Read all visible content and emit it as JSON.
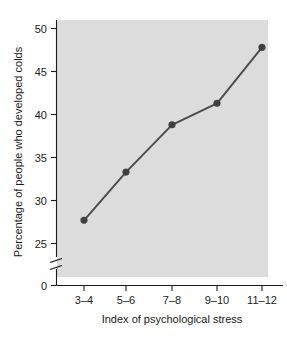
{
  "chart_data": {
    "type": "line",
    "title": "",
    "xlabel": "Index of psychological stress",
    "ylabel": "Percentage of people who developed colds",
    "categories": [
      "3–4",
      "5–6",
      "7–8",
      "9–10",
      "11–12"
    ],
    "values": [
      27.7,
      33.3,
      38.8,
      41.3,
      47.8
    ],
    "series": [
      {
        "name": "Percentage of people who developed colds",
        "values": [
          27.7,
          33.3,
          38.8,
          41.3,
          47.8
        ]
      }
    ],
    "ylim": [
      25,
      50
    ],
    "yticks": [
      25,
      30,
      35,
      40,
      45,
      50
    ],
    "ytick_labels": [
      "25",
      "30",
      "35",
      "40",
      "45",
      "50"
    ],
    "y_origin_label": "0",
    "y_axis_break": true,
    "grid": false,
    "legend": "none",
    "plot_background_color": "#dcdcdc",
    "line_color": "#4a4a4a",
    "marker_color": "#3f3f3f",
    "text_color": "#1a1a1a"
  },
  "axes": {
    "y": {
      "title": "Percentage of people who developed colds",
      "ticks": [
        {
          "label": "50",
          "value": 50
        },
        {
          "label": "45",
          "value": 45
        },
        {
          "label": "40",
          "value": 40
        },
        {
          "label": "35",
          "value": 35
        },
        {
          "label": "30",
          "value": 30
        },
        {
          "label": "25",
          "value": 25
        },
        {
          "label": "0",
          "value": 0
        }
      ]
    },
    "x": {
      "title": "Index of psychological stress",
      "ticks": [
        {
          "label": "3–4"
        },
        {
          "label": "5–6"
        },
        {
          "label": "7–8"
        },
        {
          "label": "9–10"
        },
        {
          "label": "11–12"
        }
      ]
    }
  }
}
